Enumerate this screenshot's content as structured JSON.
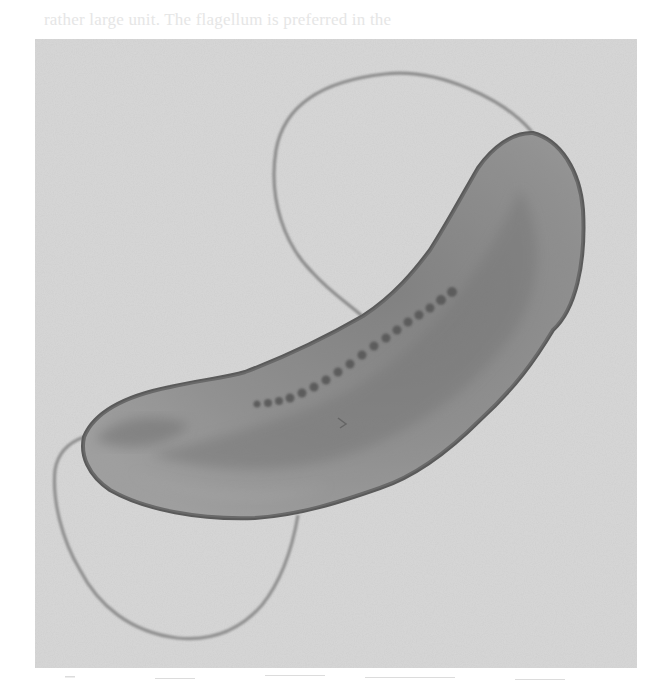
{
  "page": {
    "bleed_through_text_line1": "rather large unit. The flagellum is preferred in the",
    "bleed_through_text_line2": ""
  },
  "figure": {
    "background_color": "#d9d9d9",
    "body_color": "#8a8a8a",
    "membrane_color": "#555555",
    "flagellum_color": "#8f8f8f",
    "granule_color": "#4a4a4a"
  }
}
